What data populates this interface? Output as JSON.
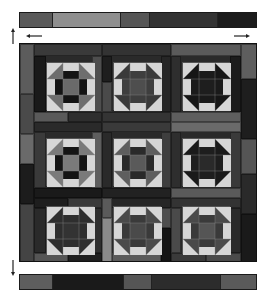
{
  "diagram": {
    "type": "quilt-layout",
    "pattern": "churn-dash-3x3",
    "colors": {
      "light": "#d6d6d6",
      "mid": "#6e6e6e",
      "midlight": "#8e8e8e",
      "dark": "#3a3a3a",
      "darker": "#262626",
      "black": "#141414",
      "background": "#ffffff"
    },
    "top_strip": {
      "segments": [
        {
          "width": 14,
          "color": "#5a5a5a"
        },
        {
          "width": 29,
          "color": "#8f8f8f"
        },
        {
          "width": 12,
          "color": "#555555"
        },
        {
          "width": 29,
          "color": "#333333"
        },
        {
          "width": 16,
          "color": "#1c1c1c"
        }
      ]
    },
    "bottom_strip": {
      "segments": [
        {
          "width": 14,
          "color": "#5e5e5e"
        },
        {
          "width": 30,
          "color": "#1a1a1a"
        },
        {
          "width": 12,
          "color": "#555555"
        },
        {
          "width": 29,
          "color": "#2c2c2c"
        },
        {
          "width": 15,
          "color": "#5a5a5a"
        }
      ]
    },
    "arrows": [
      {
        "name": "arrow-up-left",
        "direction": "up"
      },
      {
        "name": "arrow-left-top",
        "direction": "left"
      },
      {
        "name": "arrow-right-top",
        "direction": "right"
      },
      {
        "name": "arrow-down-left",
        "direction": "down"
      }
    ],
    "frame_pieces": [
      {
        "x": 0,
        "y": 0,
        "w": 14,
        "h": 50,
        "c": "#5c5c5c"
      },
      {
        "x": 0,
        "y": 50,
        "w": 14,
        "h": 40,
        "c": "#4a4a4a"
      },
      {
        "x": 0,
        "y": 90,
        "w": 14,
        "h": 30,
        "c": "#6a6a6a"
      },
      {
        "x": 0,
        "y": 120,
        "w": 14,
        "h": 40,
        "c": "#1c1c1c"
      },
      {
        "x": 0,
        "y": 160,
        "w": 14,
        "h": 59,
        "c": "#444444"
      },
      {
        "x": 14,
        "y": 0,
        "w": 68,
        "h": 12,
        "c": "#3a3a3a"
      },
      {
        "x": 82,
        "y": 0,
        "w": 69,
        "h": 12,
        "c": "#333333"
      },
      {
        "x": 151,
        "y": 0,
        "w": 70,
        "h": 12,
        "c": "#5a5a5a"
      },
      {
        "x": 221,
        "y": 0,
        "w": 17,
        "h": 35,
        "c": "#5e5e5e"
      },
      {
        "x": 221,
        "y": 35,
        "w": 17,
        "h": 60,
        "c": "#1e1e1e"
      },
      {
        "x": 221,
        "y": 95,
        "w": 17,
        "h": 35,
        "c": "#555555"
      },
      {
        "x": 221,
        "y": 130,
        "w": 17,
        "h": 40,
        "c": "#2a2a2a"
      },
      {
        "x": 221,
        "y": 170,
        "w": 17,
        "h": 49,
        "c": "#1a1a1a"
      },
      {
        "x": 14,
        "y": 12,
        "w": 12,
        "h": 56,
        "c": "#1a1a1a"
      },
      {
        "x": 72,
        "y": 12,
        "w": 10,
        "h": 56,
        "c": "#4e4e4e"
      },
      {
        "x": 82,
        "y": 12,
        "w": 10,
        "h": 26,
        "c": "#1e1e1e"
      },
      {
        "x": 82,
        "y": 38,
        "w": 10,
        "h": 30,
        "c": "#4a4a4a"
      },
      {
        "x": 141,
        "y": 12,
        "w": 10,
        "h": 56,
        "c": "#262626"
      },
      {
        "x": 151,
        "y": 12,
        "w": 10,
        "h": 56,
        "c": "#2e2e2e"
      },
      {
        "x": 210,
        "y": 12,
        "w": 11,
        "h": 56,
        "c": "#1c1c1c"
      },
      {
        "x": 14,
        "y": 68,
        "w": 34,
        "h": 10,
        "c": "#5a5a5a"
      },
      {
        "x": 48,
        "y": 68,
        "w": 34,
        "h": 10,
        "c": "#2e2e2e"
      },
      {
        "x": 82,
        "y": 68,
        "w": 69,
        "h": 10,
        "c": "#343434"
      },
      {
        "x": 151,
        "y": 68,
        "w": 70,
        "h": 10,
        "c": "#5e5e5e"
      },
      {
        "x": 14,
        "y": 78,
        "w": 68,
        "h": 10,
        "c": "#2a2a2a"
      },
      {
        "x": 82,
        "y": 78,
        "w": 69,
        "h": 10,
        "c": "#3a3a3a"
      },
      {
        "x": 151,
        "y": 78,
        "w": 70,
        "h": 10,
        "c": "#6a6a6a"
      },
      {
        "x": 14,
        "y": 88,
        "w": 12,
        "h": 56,
        "c": "#3a3a3a"
      },
      {
        "x": 72,
        "y": 88,
        "w": 10,
        "h": 56,
        "c": "#5e5e5e"
      },
      {
        "x": 82,
        "y": 88,
        "w": 10,
        "h": 56,
        "c": "#2a2a2a"
      },
      {
        "x": 141,
        "y": 88,
        "w": 10,
        "h": 56,
        "c": "#3e3e3e"
      },
      {
        "x": 151,
        "y": 88,
        "w": 10,
        "h": 56,
        "c": "#2e2e2e"
      },
      {
        "x": 210,
        "y": 88,
        "w": 11,
        "h": 56,
        "c": "#3a3a3a"
      },
      {
        "x": 14,
        "y": 144,
        "w": 68,
        "h": 10,
        "c": "#1a1a1a"
      },
      {
        "x": 82,
        "y": 144,
        "w": 69,
        "h": 10,
        "c": "#222222"
      },
      {
        "x": 151,
        "y": 144,
        "w": 70,
        "h": 10,
        "c": "#5a5a5a"
      },
      {
        "x": 14,
        "y": 154,
        "w": 34,
        "h": 10,
        "c": "#1e1e1e"
      },
      {
        "x": 48,
        "y": 154,
        "w": 34,
        "h": 10,
        "c": "#3a3a3a"
      },
      {
        "x": 82,
        "y": 154,
        "w": 69,
        "h": 10,
        "c": "#262626"
      },
      {
        "x": 151,
        "y": 154,
        "w": 70,
        "h": 10,
        "c": "#333333"
      },
      {
        "x": 14,
        "y": 164,
        "w": 12,
        "h": 45,
        "c": "#2a2a2a"
      },
      {
        "x": 72,
        "y": 164,
        "w": 10,
        "h": 45,
        "c": "#2e2e2e"
      },
      {
        "x": 82,
        "y": 154,
        "w": 10,
        "h": 20,
        "c": "#5a5a5a"
      },
      {
        "x": 82,
        "y": 174,
        "w": 10,
        "h": 45,
        "c": "#8a8a8a"
      },
      {
        "x": 141,
        "y": 164,
        "w": 10,
        "h": 20,
        "c": "#4e4e4e"
      },
      {
        "x": 141,
        "y": 184,
        "w": 10,
        "h": 35,
        "c": "#141414"
      },
      {
        "x": 151,
        "y": 164,
        "w": 10,
        "h": 45,
        "c": "#4a4a4a"
      },
      {
        "x": 210,
        "y": 164,
        "w": 11,
        "h": 45,
        "c": "#2a2a2a"
      },
      {
        "x": 14,
        "y": 209,
        "w": 34,
        "h": 10,
        "c": "#555555"
      },
      {
        "x": 48,
        "y": 209,
        "w": 34,
        "h": 10,
        "c": "#1e1e1e"
      },
      {
        "x": 92,
        "y": 209,
        "w": 49,
        "h": 10,
        "c": "#5a5a5a"
      },
      {
        "x": 151,
        "y": 209,
        "w": 35,
        "h": 10,
        "c": "#3a3a3a"
      },
      {
        "x": 186,
        "y": 209,
        "w": 35,
        "h": 10,
        "c": "#4a4a4a"
      }
    ],
    "blocks": [
      {
        "row": 1,
        "col": 1,
        "x": 26,
        "y": 18,
        "triangle": "#6e6e6e",
        "bar": "#8e8e8e",
        "ring": "#141414",
        "center": "#6a6a6a"
      },
      {
        "row": 1,
        "col": 2,
        "x": 93,
        "y": 18,
        "triangle": "#3a3a3a",
        "bar": "#4e4e4e",
        "ring": "#3e3e3e",
        "center": "#4e4e4e"
      },
      {
        "row": 1,
        "col": 3,
        "x": 162,
        "y": 18,
        "triangle": "#161616",
        "bar": "#4a4a4a",
        "ring": "#1a1a1a",
        "center": "#1e1e1e"
      },
      {
        "row": 2,
        "col": 1,
        "x": 26,
        "y": 94,
        "triangle": "#7a7a7a",
        "bar": "#9a9a9a",
        "ring": "#141414",
        "center": "#7a7a7a"
      },
      {
        "row": 2,
        "col": 2,
        "x": 93,
        "y": 94,
        "triangle": "#5e5e5e",
        "bar": "#4a4a4a",
        "ring": "#2a2a2a",
        "center": "#5a5a5a"
      },
      {
        "row": 2,
        "col": 3,
        "x": 162,
        "y": 94,
        "triangle": "#1a1a1a",
        "bar": "#6a6a6a",
        "ring": "#1e1e1e",
        "center": "#2a2a2a"
      },
      {
        "row": 3,
        "col": 1,
        "x": 26,
        "y": 162,
        "triangle": "#2e2e2e",
        "bar": "#5a5a5a",
        "ring": "#2e2e2e",
        "center": "#333333"
      },
      {
        "row": 3,
        "col": 2,
        "x": 93,
        "y": 162,
        "triangle": "#4a4a4a",
        "bar": "#555555",
        "ring": "#3a3a3a",
        "center": "#4a4a4a"
      },
      {
        "row": 3,
        "col": 3,
        "x": 162,
        "y": 162,
        "triangle": "#4a4a4a",
        "bar": "#555555",
        "ring": "#3a3a3a",
        "center": "#555555"
      }
    ]
  }
}
